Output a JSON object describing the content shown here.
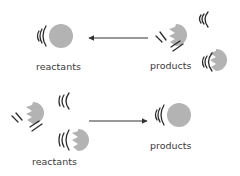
{
  "colors": {
    "particle": "#b3b3b3",
    "motion_lines": "#2a2a2a",
    "arrow": "#333333",
    "text": "#3a3a3a"
  },
  "top_panel": {
    "left_label": "reactants",
    "right_label": "products",
    "arrow_direction": "left",
    "left_content": "intact-particle",
    "right_content": "fragmented-particles"
  },
  "bottom_panel": {
    "left_label": "reactants",
    "right_label": "products",
    "arrow_direction": "right",
    "left_content": "fragmented-particles",
    "right_content": "intact-particle"
  }
}
